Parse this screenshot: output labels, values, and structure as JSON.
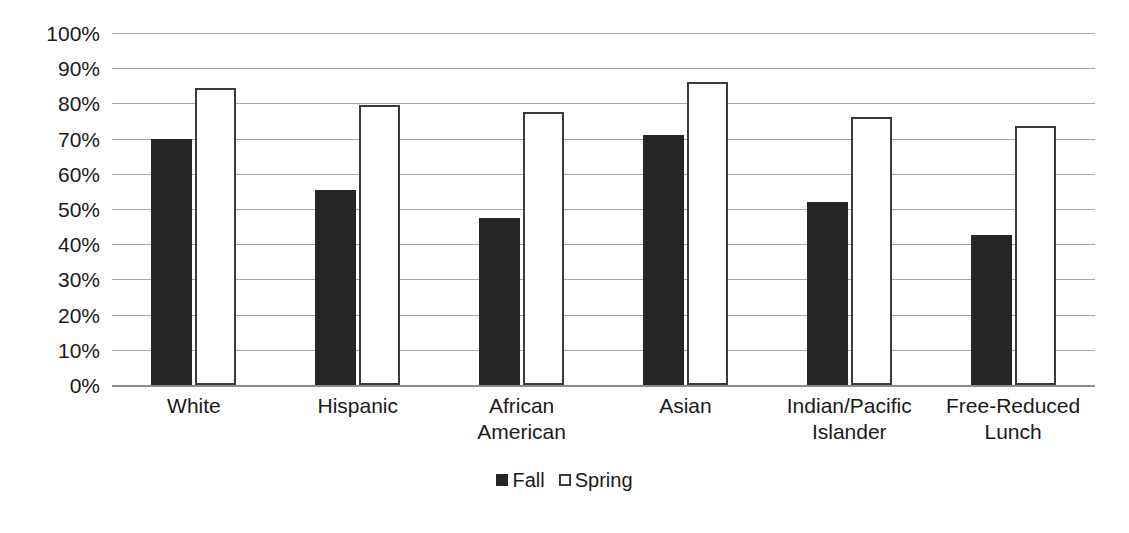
{
  "chart_data": {
    "type": "bar",
    "title": "",
    "xlabel": "",
    "ylabel": "",
    "ylim": [
      0,
      100
    ],
    "y_unit": "%",
    "grid": true,
    "legend_position": "bottom",
    "categories": [
      "White",
      "Hispanic",
      "African American",
      "Asian",
      "Indian/Pacific Islander",
      "Free-Reduced Lunch"
    ],
    "category_lines": [
      [
        "White"
      ],
      [
        "Hispanic"
      ],
      [
        "African",
        "American"
      ],
      [
        "Asian"
      ],
      [
        "Indian/Pacific",
        "Islander"
      ],
      [
        "Free-Reduced",
        "Lunch"
      ]
    ],
    "ytick_labels": [
      "100%",
      "90%",
      "80%",
      "70%",
      "60%",
      "50%",
      "40%",
      "30%",
      "20%",
      "10%",
      "0%"
    ],
    "ytick_values": [
      100,
      90,
      80,
      70,
      60,
      50,
      40,
      30,
      20,
      10,
      0
    ],
    "series": [
      {
        "name": "Fall",
        "color": "#262626",
        "fill": "solid",
        "values": [
          70,
          55.5,
          47.5,
          71,
          52,
          42.5
        ]
      },
      {
        "name": "Spring",
        "color": "#ffffff",
        "fill": "outline",
        "outline_color": "#3a3a3a",
        "values": [
          84.5,
          79.5,
          77.5,
          86,
          76,
          73.5
        ]
      }
    ]
  },
  "legend": {
    "items": [
      {
        "label": "Fall",
        "swatch": "filled-square-icon"
      },
      {
        "label": "Spring",
        "swatch": "outlined-square-icon"
      }
    ]
  },
  "colors": {
    "fall": "#262626",
    "spring_outline": "#3a3a3a",
    "gridline": "#a6a6a6",
    "axis": "#8c8c8c",
    "text": "#1a1a1a",
    "background": "#ffffff"
  }
}
